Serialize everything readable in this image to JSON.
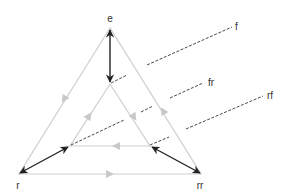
{
  "diagram": {
    "type": "symmetry-triangle",
    "nodes": {
      "e": "e",
      "r": "r",
      "rr": "rr"
    },
    "reflection_labels": {
      "f": "f",
      "fr": "fr",
      "rf": "rf"
    },
    "colors": {
      "triangle_edges": "#cfcfcf",
      "edge_arrows": "#c8c8c8",
      "double_arrows": "#222222",
      "dashed_axes": "#333333",
      "label_text": "#333333"
    },
    "edges": [
      {
        "from": "e",
        "to": "r",
        "style": "grey-arrow"
      },
      {
        "from": "r",
        "to": "rr",
        "style": "grey-arrow"
      },
      {
        "from": "rr",
        "to": "e",
        "style": "grey-arrow"
      },
      {
        "from": "inner-left",
        "to": "inner-top",
        "style": "grey-arrow"
      },
      {
        "from": "inner-top",
        "to": "inner-right",
        "style": "grey-arrow"
      },
      {
        "from": "inner-right",
        "to": "inner-left",
        "style": "grey-arrow"
      },
      {
        "from": "e",
        "to": "inner-top",
        "style": "black-double-arrow"
      },
      {
        "from": "r",
        "to": "inner-left",
        "style": "black-double-arrow"
      },
      {
        "from": "rr",
        "to": "inner-right",
        "style": "black-double-arrow"
      }
    ]
  }
}
